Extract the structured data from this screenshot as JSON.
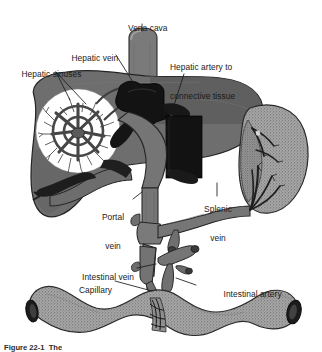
{
  "figure": {
    "caption_partial": "Figure 22-1  The",
    "labels": [
      {
        "id": "vena-cava",
        "text": "Vena cava",
        "lines": [
          "Vena cava"
        ]
      },
      {
        "id": "hepatic-vein",
        "text": "Hepatic vein",
        "lines": [
          "Hepatic vein"
        ]
      },
      {
        "id": "hepatic-sinuses",
        "text": "Hepatic sinuses",
        "lines": [
          "Hepatic sinuses"
        ]
      },
      {
        "id": "hepatic-artery",
        "text": "Hepatic artery to connective tissue",
        "lines": [
          "Hepatic artery to",
          "connective tissue"
        ]
      },
      {
        "id": "portal-vein",
        "text": "Portal vein",
        "lines": [
          "Portal",
          "vein"
        ]
      },
      {
        "id": "splenic-vein",
        "text": "Splenic vein",
        "lines": [
          "Splenic",
          "vein"
        ]
      },
      {
        "id": "intestinal-vein",
        "text": "Intestinal vein",
        "lines": [
          "Intestinal vein"
        ]
      },
      {
        "id": "capillary",
        "text": "Capillary",
        "lines": [
          "Capillary"
        ]
      },
      {
        "id": "intestinal-artery",
        "text": "Intestinal artery",
        "lines": [
          "Intestinal artery"
        ]
      }
    ],
    "structures": [
      {
        "id": "liver",
        "name": "liver"
      },
      {
        "id": "vena-cava-vessel",
        "name": "inferior vena cava"
      },
      {
        "id": "hepatic-vein-vessel",
        "name": "hepatic vein"
      },
      {
        "id": "sinusoid-inset",
        "name": "hepatic sinusoid detail circle"
      },
      {
        "id": "gallbladder",
        "name": "hepatic artery / connective tissue block"
      },
      {
        "id": "spleen",
        "name": "spleen"
      },
      {
        "id": "splenic-vein-vessel",
        "name": "splenic vein"
      },
      {
        "id": "portal-vein-vessel",
        "name": "portal vein"
      },
      {
        "id": "intestine",
        "name": "intestine"
      },
      {
        "id": "mesenteric-vessels",
        "name": "intestinal vein and artery"
      }
    ],
    "colors": {
      "background": "#ffffff",
      "liver_gray": "#6e6e6e",
      "liver_dark": "#4a4a4a",
      "vessel_gray": "#767676",
      "vessel_dark": "#3a3a3a",
      "black_structure": "#141414",
      "spleen_gray": "#8f8f8f",
      "intestine_gray": "#969696",
      "outline": "#262626",
      "label_text": "#1a1a1a",
      "leader_line": "#1a1a1a"
    }
  }
}
